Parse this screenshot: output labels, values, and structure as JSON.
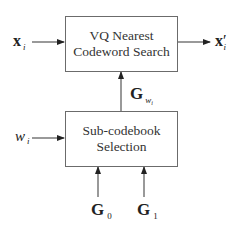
{
  "diagram": {
    "top_box": {
      "line1": "VQ Nearest",
      "line2": "Codeword Search"
    },
    "bottom_box": {
      "line1": "Sub-codebook",
      "line2": "Selection"
    },
    "inputs": {
      "x_label": "x",
      "x_sub": "i",
      "w_label": "w",
      "w_sub": "i",
      "g0_label": "G",
      "g0_sub": "0",
      "g1_label": "G",
      "g1_sub": "1"
    },
    "outputs": {
      "xprime_label": "x",
      "xprime_prime": "′",
      "xprime_sub": "i"
    },
    "connection": {
      "gw_label": "G",
      "gw_sub": "w",
      "gw_subsub": "i"
    },
    "colors": {
      "line": "#6b6b6b",
      "arrow": "#222222",
      "text": "#222222"
    }
  }
}
